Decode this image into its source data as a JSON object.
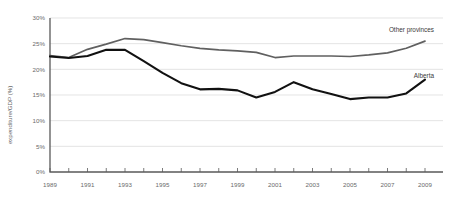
{
  "chart_data": {
    "type": "line",
    "title": "",
    "xlabel": "",
    "ylabel": "expenditure/GDP (%)",
    "xlim": [
      1989,
      2009
    ],
    "ylim": [
      0,
      30
    ],
    "grid": true,
    "legend_position": "inline-right",
    "y_ticks": [
      "0%",
      "5%",
      "10%",
      "15%",
      "20%",
      "25%",
      "30%"
    ],
    "y_tick_values": [
      0,
      5,
      10,
      15,
      20,
      25,
      30
    ],
    "x_ticks": [
      "1989",
      "1991",
      "1993",
      "1995",
      "1997",
      "1999",
      "2001",
      "2003",
      "2005",
      "2007",
      "2009"
    ],
    "x_tick_values": [
      1989,
      1991,
      1993,
      1995,
      1997,
      1999,
      2001,
      2003,
      2005,
      2007,
      2009
    ],
    "x": [
      1989,
      1990,
      1991,
      1992,
      1993,
      1994,
      1995,
      1996,
      1997,
      1998,
      1999,
      2000,
      2001,
      2002,
      2003,
      2004,
      2005,
      2006,
      2007,
      2008,
      2009
    ],
    "series": [
      {
        "name": "Other provinces",
        "color": "#606060",
        "values": [
          22.7,
          22.3,
          23.9,
          24.9,
          26.0,
          25.8,
          25.2,
          24.6,
          24.1,
          23.8,
          23.6,
          23.3,
          22.3,
          22.6,
          22.6,
          22.6,
          22.5,
          22.8,
          23.2,
          24.1,
          25.5
        ]
      },
      {
        "name": "Alberta",
        "color": "#111111",
        "values": [
          22.5,
          22.2,
          22.6,
          23.8,
          23.8,
          21.6,
          19.3,
          17.3,
          16.1,
          16.2,
          15.9,
          14.5,
          15.6,
          17.5,
          16.1,
          15.2,
          14.2,
          14.5,
          14.5,
          15.3,
          18.0
        ]
      }
    ]
  },
  "labels": {
    "other_provinces": "Other provinces",
    "alberta": "Alberta"
  }
}
